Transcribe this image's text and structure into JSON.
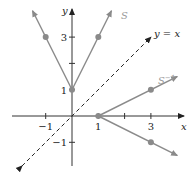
{
  "figure": {
    "x_axis_label": "x",
    "y_axis_label": "y",
    "x_ticks": [
      -1,
      1,
      2,
      3
    ],
    "x_tick_labels": {
      "-1": "−1",
      "1": "1",
      "3": "3"
    },
    "y_ticks": [
      -1,
      1,
      2,
      3
    ],
    "y_tick_labels": {
      "-1": "−1",
      "1": "1",
      "3": "3"
    },
    "curves": {
      "S": {
        "label": "S",
        "vertex": [
          0,
          1
        ],
        "points": [
          [
            -1,
            3
          ],
          [
            1,
            3
          ]
        ],
        "color": "#8a8a8a"
      },
      "S_inverse": {
        "label": "S",
        "label_sup": "−1",
        "vertex": [
          1,
          0
        ],
        "points": [
          [
            3,
            1
          ],
          [
            3,
            -1
          ]
        ],
        "color": "#8a8a8a"
      },
      "identity": {
        "label": "y = x",
        "style": "dashed",
        "color": "#222222"
      }
    },
    "axis_color": "#333333"
  }
}
